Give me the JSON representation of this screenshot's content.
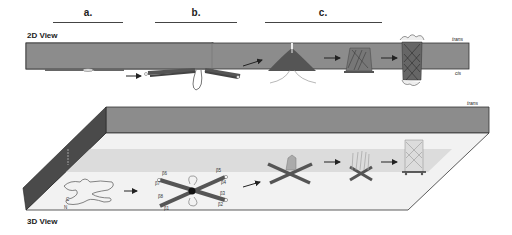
{
  "stages": [
    {
      "label": "a.",
      "x1": 53,
      "x2": 123
    },
    {
      "label": "b.",
      "x1": 155,
      "x2": 237
    },
    {
      "label": "c.",
      "x1": 265,
      "x2": 382
    }
  ],
  "view2d": {
    "title": "2D View",
    "trans_label": "trans",
    "cis_label": "cis",
    "membrane_color": "#8c8c8c"
  },
  "view3d": {
    "title": "3D View",
    "trans_label": "trans",
    "cis_label": "cis",
    "top_slab_color": "#8c8c8c",
    "side_wall_color": "#4a4a4a",
    "floor_color": "#f2f2f2",
    "band_color": "#dcdcdc",
    "strand_labels": [
      "β6",
      "β5",
      "β7",
      "β4",
      "β8",
      "β3",
      "β1",
      "β2"
    ],
    "terminus_labels": [
      "C",
      "N"
    ]
  },
  "colors": {
    "strand": "#555555",
    "arrow": "#222222"
  }
}
